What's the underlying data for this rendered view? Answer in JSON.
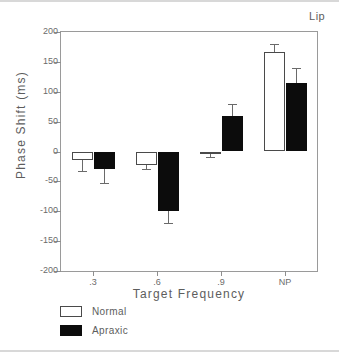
{
  "chart_data": {
    "type": "bar",
    "title": "Lip",
    "xlabel": "Target Frequency",
    "ylabel": "Phase Shift (ms)",
    "categories": [
      ".3",
      ".6",
      ".9",
      "NP"
    ],
    "ylim": [
      -200,
      200
    ],
    "yticks": [
      200,
      150,
      100,
      50,
      0,
      -50,
      -100,
      -150,
      -200
    ],
    "ytick_labels": [
      "200",
      "150",
      "100",
      "50",
      "0",
      "-50",
      "-100",
      "-150",
      "-200"
    ],
    "grid": false,
    "legend_position": "below-left",
    "series": [
      {
        "name": "Normal",
        "color": "#ffffff",
        "edge_color": "#4a4a4a",
        "values": [
          -14,
          -22,
          -5,
          166
        ],
        "errors": [
          19,
          8,
          4,
          14
        ]
      },
      {
        "name": "Apraxic",
        "color": "#0c0c0c",
        "edge_color": "#0c0c0c",
        "values": [
          -29,
          -100,
          59,
          115
        ],
        "errors": [
          23,
          20,
          21,
          24
        ]
      }
    ]
  },
  "legend": {
    "items": [
      {
        "label": "Normal",
        "swatch": "normal"
      },
      {
        "label": "Apraxic",
        "swatch": "apraxic"
      }
    ]
  }
}
